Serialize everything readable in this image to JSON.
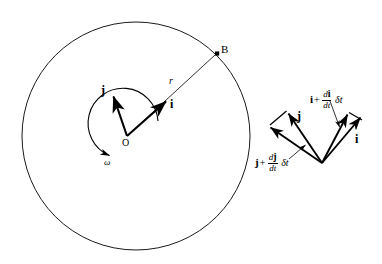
{
  "figure": {
    "background_color": "#ffffff",
    "stroke_color": "#000000",
    "circle": {
      "cx": 136,
      "cy": 136,
      "r": 114
    }
  },
  "left_diagram": {
    "origin_label": "O",
    "point_b_label": "B",
    "radius_label": "r",
    "i_label": "i",
    "j_label": "j",
    "omega_label": "ω",
    "origin": {
      "x": 127,
      "y": 136
    },
    "point_b": {
      "x": 217,
      "y": 53
    },
    "i_tip": {
      "x": 168,
      "y": 101
    },
    "j_tip": {
      "x": 112,
      "y": 94
    }
  },
  "right_diagram": {
    "vertex": {
      "x": 322,
      "y": 163
    },
    "i_label": "i",
    "j_label": "j",
    "di_expression": {
      "vector": "i",
      "operator": "+",
      "numerator": "d",
      "numerator_vector": "i",
      "denominator": "dt",
      "suffix": "δt"
    },
    "dj_expression": {
      "vector": "j",
      "operator": "+",
      "numerator": "d",
      "numerator_vector": "j",
      "denominator": "dt",
      "suffix": "δt"
    }
  }
}
